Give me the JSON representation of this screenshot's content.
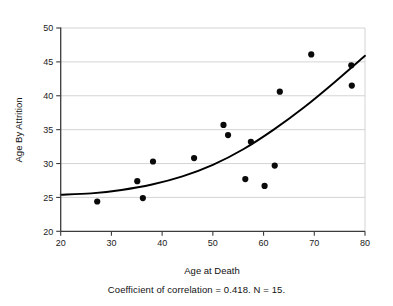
{
  "figure": {
    "caption": "Coefficient of correlation = 0.418. N = 15."
  },
  "chart_data": {
    "type": "scatter",
    "title": "",
    "xlabel": "Age at Death",
    "ylabel": "Age By Attrition",
    "xlim": [
      20,
      80
    ],
    "ylim": [
      20,
      50
    ],
    "xticks": [
      20,
      30,
      40,
      50,
      60,
      70,
      80
    ],
    "yticks": [
      20,
      25,
      30,
      35,
      40,
      45,
      50
    ],
    "xtick_labels": [
      "20",
      "30",
      "40",
      "50",
      "60",
      "70",
      "80"
    ],
    "ytick_labels": [
      "20",
      "25",
      "30",
      "35",
      "40",
      "45",
      "50"
    ],
    "grid": "horizontal",
    "legend": "none",
    "marker": "filled-circle",
    "marker_color": "#0a0a0a",
    "n": 15,
    "correlation": 0.418,
    "points": [
      {
        "x": 27.2,
        "y": 24.4
      },
      {
        "x": 35.1,
        "y": 27.4
      },
      {
        "x": 36.2,
        "y": 24.9
      },
      {
        "x": 38.2,
        "y": 30.3
      },
      {
        "x": 46.3,
        "y": 30.8
      },
      {
        "x": 52.1,
        "y": 35.7
      },
      {
        "x": 53.0,
        "y": 34.2
      },
      {
        "x": 56.4,
        "y": 27.7
      },
      {
        "x": 57.5,
        "y": 33.2
      },
      {
        "x": 60.2,
        "y": 26.7
      },
      {
        "x": 62.2,
        "y": 29.7
      },
      {
        "x": 63.2,
        "y": 40.6
      },
      {
        "x": 69.4,
        "y": 46.1
      },
      {
        "x": 77.3,
        "y": 44.5
      },
      {
        "x": 77.4,
        "y": 41.5
      }
    ],
    "fit_curve": {
      "kind": "exponential-trend",
      "color": "#000000",
      "x_start": 20,
      "x_end": 80,
      "y_start": 25.4,
      "y_end": 45.9,
      "samples": [
        {
          "x": 20,
          "y": 25.4
        },
        {
          "x": 26,
          "y": 25.6
        },
        {
          "x": 32,
          "y": 26.1
        },
        {
          "x": 38,
          "y": 26.9
        },
        {
          "x": 44,
          "y": 28.1
        },
        {
          "x": 50,
          "y": 29.8
        },
        {
          "x": 56,
          "y": 32.1
        },
        {
          "x": 62,
          "y": 35.0
        },
        {
          "x": 68,
          "y": 38.3
        },
        {
          "x": 74,
          "y": 42.0
        },
        {
          "x": 80,
          "y": 45.9
        }
      ]
    }
  }
}
